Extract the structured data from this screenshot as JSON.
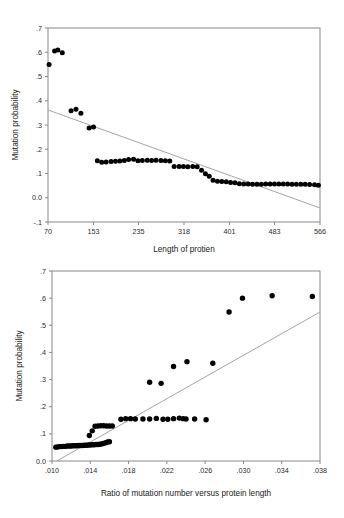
{
  "chart_data": [
    {
      "id": "top",
      "type": "scatter",
      "title": "",
      "xlabel": "Length of protien",
      "ylabel": "Mutation probability",
      "xlim": [
        70,
        566
      ],
      "ylim": [
        -0.1,
        0.7
      ],
      "xticks": [
        70,
        153,
        235,
        318,
        401,
        483,
        566
      ],
      "xticklabels": [
        "70",
        "153",
        "235",
        "318",
        "401",
        "483",
        "566"
      ],
      "yticks": [
        -0.1,
        0.0,
        0.1,
        0.2,
        0.3,
        0.4,
        0.5,
        0.6,
        0.7
      ],
      "yticklabels": [
        "-.1",
        "0.0",
        ".1",
        ".2",
        ".3",
        ".4",
        ".5",
        ".6",
        ".7"
      ],
      "grid": false,
      "legend": "none",
      "marker_color": "#000000",
      "fitline_color": "#9a9a9a",
      "fitline": {
        "x0": 70,
        "y0": 0.362,
        "x1": 566,
        "y1": -0.042
      },
      "points": [
        {
          "x": 72,
          "y": 0.549
        },
        {
          "x": 82,
          "y": 0.605
        },
        {
          "x": 88,
          "y": 0.609
        },
        {
          "x": 96,
          "y": 0.598
        },
        {
          "x": 112,
          "y": 0.359
        },
        {
          "x": 121,
          "y": 0.365
        },
        {
          "x": 130,
          "y": 0.348
        },
        {
          "x": 145,
          "y": 0.288
        },
        {
          "x": 153,
          "y": 0.292
        },
        {
          "x": 160,
          "y": 0.153
        },
        {
          "x": 168,
          "y": 0.146
        },
        {
          "x": 176,
          "y": 0.147
        },
        {
          "x": 185,
          "y": 0.149
        },
        {
          "x": 193,
          "y": 0.151
        },
        {
          "x": 201,
          "y": 0.152
        },
        {
          "x": 209,
          "y": 0.154
        },
        {
          "x": 217,
          "y": 0.158
        },
        {
          "x": 226,
          "y": 0.159
        },
        {
          "x": 234,
          "y": 0.153
        },
        {
          "x": 242,
          "y": 0.154
        },
        {
          "x": 251,
          "y": 0.155
        },
        {
          "x": 259,
          "y": 0.154
        },
        {
          "x": 267,
          "y": 0.155
        },
        {
          "x": 276,
          "y": 0.154
        },
        {
          "x": 284,
          "y": 0.153
        },
        {
          "x": 292,
          "y": 0.152
        },
        {
          "x": 300,
          "y": 0.129
        },
        {
          "x": 309,
          "y": 0.129
        },
        {
          "x": 317,
          "y": 0.129
        },
        {
          "x": 325,
          "y": 0.128
        },
        {
          "x": 334,
          "y": 0.129
        },
        {
          "x": 342,
          "y": 0.128
        },
        {
          "x": 350,
          "y": 0.113
        },
        {
          "x": 357,
          "y": 0.099
        },
        {
          "x": 364,
          "y": 0.089
        },
        {
          "x": 371,
          "y": 0.072
        },
        {
          "x": 379,
          "y": 0.068
        },
        {
          "x": 387,
          "y": 0.067
        },
        {
          "x": 395,
          "y": 0.066
        },
        {
          "x": 403,
          "y": 0.063
        },
        {
          "x": 411,
          "y": 0.062
        },
        {
          "x": 419,
          "y": 0.058
        },
        {
          "x": 427,
          "y": 0.057
        },
        {
          "x": 435,
          "y": 0.057
        },
        {
          "x": 443,
          "y": 0.056
        },
        {
          "x": 451,
          "y": 0.056
        },
        {
          "x": 459,
          "y": 0.056
        },
        {
          "x": 467,
          "y": 0.057
        },
        {
          "x": 475,
          "y": 0.057
        },
        {
          "x": 483,
          "y": 0.057
        },
        {
          "x": 491,
          "y": 0.057
        },
        {
          "x": 499,
          "y": 0.057
        },
        {
          "x": 507,
          "y": 0.057
        },
        {
          "x": 515,
          "y": 0.056
        },
        {
          "x": 523,
          "y": 0.056
        },
        {
          "x": 531,
          "y": 0.056
        },
        {
          "x": 539,
          "y": 0.056
        },
        {
          "x": 547,
          "y": 0.055
        },
        {
          "x": 556,
          "y": 0.054
        },
        {
          "x": 563,
          "y": 0.052
        }
      ]
    },
    {
      "id": "bottom",
      "type": "scatter",
      "title": "",
      "xlabel": "Ratio of mutation number versus protein length",
      "ylabel": "Mutation probability",
      "xlim": [
        0.01,
        0.038
      ],
      "ylim": [
        0.0,
        0.7
      ],
      "xticks": [
        0.01,
        0.014,
        0.018,
        0.022,
        0.026,
        0.03,
        0.034,
        0.038
      ],
      "xticklabels": [
        ".010",
        ".014",
        ".018",
        ".022",
        ".026",
        ".030",
        ".034",
        ".038"
      ],
      "yticks": [
        0.0,
        0.1,
        0.2,
        0.3,
        0.4,
        0.5,
        0.6,
        0.7
      ],
      "yticklabels": [
        "0.0",
        ".1",
        ".2",
        ".3",
        ".4",
        ".5",
        ".6",
        ".7"
      ],
      "grid": false,
      "legend": "none",
      "marker_color": "#000000",
      "fitline_color": "#9a9a9a",
      "fitline": {
        "x0": 0.0105,
        "y0": 0.0,
        "x1": 0.038,
        "y1": 0.549
      },
      "points": [
        {
          "x": 0.0104,
          "y": 0.051
        },
        {
          "x": 0.0106,
          "y": 0.052
        },
        {
          "x": 0.0108,
          "y": 0.053
        },
        {
          "x": 0.011,
          "y": 0.053
        },
        {
          "x": 0.0112,
          "y": 0.054
        },
        {
          "x": 0.0114,
          "y": 0.054
        },
        {
          "x": 0.0116,
          "y": 0.055
        },
        {
          "x": 0.0118,
          "y": 0.055
        },
        {
          "x": 0.012,
          "y": 0.055
        },
        {
          "x": 0.0122,
          "y": 0.056
        },
        {
          "x": 0.0124,
          "y": 0.056
        },
        {
          "x": 0.0126,
          "y": 0.056
        },
        {
          "x": 0.0128,
          "y": 0.057
        },
        {
          "x": 0.013,
          "y": 0.057
        },
        {
          "x": 0.0132,
          "y": 0.057
        },
        {
          "x": 0.0134,
          "y": 0.058
        },
        {
          "x": 0.0136,
          "y": 0.058
        },
        {
          "x": 0.0138,
          "y": 0.059
        },
        {
          "x": 0.014,
          "y": 0.059
        },
        {
          "x": 0.0142,
          "y": 0.06
        },
        {
          "x": 0.0144,
          "y": 0.06
        },
        {
          "x": 0.0146,
          "y": 0.061
        },
        {
          "x": 0.0148,
          "y": 0.061
        },
        {
          "x": 0.015,
          "y": 0.062
        },
        {
          "x": 0.0152,
          "y": 0.063
        },
        {
          "x": 0.0154,
          "y": 0.065
        },
        {
          "x": 0.0156,
          "y": 0.067
        },
        {
          "x": 0.0158,
          "y": 0.07
        },
        {
          "x": 0.016,
          "y": 0.071
        },
        {
          "x": 0.0139,
          "y": 0.094
        },
        {
          "x": 0.0142,
          "y": 0.111
        },
        {
          "x": 0.0145,
          "y": 0.128
        },
        {
          "x": 0.0148,
          "y": 0.129
        },
        {
          "x": 0.0151,
          "y": 0.13
        },
        {
          "x": 0.0154,
          "y": 0.13
        },
        {
          "x": 0.0157,
          "y": 0.129
        },
        {
          "x": 0.016,
          "y": 0.129
        },
        {
          "x": 0.0163,
          "y": 0.129
        },
        {
          "x": 0.0172,
          "y": 0.154
        },
        {
          "x": 0.0177,
          "y": 0.156
        },
        {
          "x": 0.0182,
          "y": 0.156
        },
        {
          "x": 0.0187,
          "y": 0.155
        },
        {
          "x": 0.0195,
          "y": 0.155
        },
        {
          "x": 0.0202,
          "y": 0.155
        },
        {
          "x": 0.0209,
          "y": 0.157
        },
        {
          "x": 0.0216,
          "y": 0.154
        },
        {
          "x": 0.0221,
          "y": 0.154
        },
        {
          "x": 0.0227,
          "y": 0.156
        },
        {
          "x": 0.0233,
          "y": 0.158
        },
        {
          "x": 0.0237,
          "y": 0.156
        },
        {
          "x": 0.024,
          "y": 0.155
        },
        {
          "x": 0.0249,
          "y": 0.155
        },
        {
          "x": 0.0261,
          "y": 0.152
        },
        {
          "x": 0.0202,
          "y": 0.29
        },
        {
          "x": 0.0214,
          "y": 0.286
        },
        {
          "x": 0.0227,
          "y": 0.348
        },
        {
          "x": 0.0241,
          "y": 0.366
        },
        {
          "x": 0.0268,
          "y": 0.36
        },
        {
          "x": 0.0285,
          "y": 0.549
        },
        {
          "x": 0.0299,
          "y": 0.6
        },
        {
          "x": 0.033,
          "y": 0.609
        },
        {
          "x": 0.0372,
          "y": 0.606
        }
      ]
    }
  ]
}
